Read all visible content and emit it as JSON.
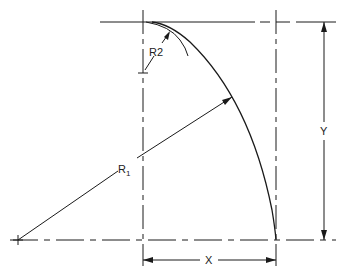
{
  "diagram": {
    "type": "engineering-drawing",
    "colors": {
      "line": "#1a1a1a",
      "background": "#ffffff"
    },
    "labels": {
      "r1_main": "R",
      "r1_sub": "1",
      "r2_main": "R",
      "r2_sub": "2",
      "x": "X",
      "y": "Y"
    },
    "dimensions": [
      {
        "name": "X",
        "description": "horizontal distance between vertical centerlines"
      },
      {
        "name": "Y",
        "description": "vertical distance between horizontal lines"
      }
    ],
    "radii": [
      {
        "name": "R1",
        "description": "large radius from center at lower left to arc"
      },
      {
        "name": "R2",
        "description": "small radius near the top tangent point"
      }
    ]
  }
}
